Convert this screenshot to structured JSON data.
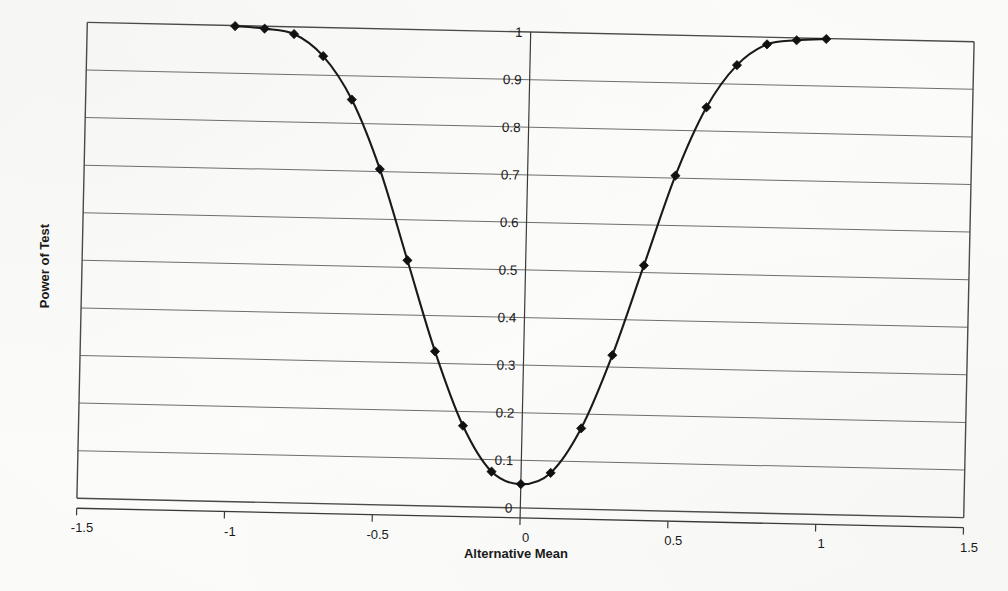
{
  "chart_data": {
    "type": "line",
    "title": "",
    "xlabel": "Alternative Mean",
    "ylabel": "Power of Test",
    "xlim": [
      -1.5,
      1.5
    ],
    "ylim": [
      0,
      1
    ],
    "grid": "horizontal",
    "legend": "none",
    "marker": "diamond",
    "line_color": "#1a1a1a",
    "marker_color": "#111111",
    "grid_color": "#6e6e6e",
    "axis_color": "#4a4a4a",
    "x_ticks": [
      "-1.5",
      "-1",
      "-0.5",
      "0",
      "0.5",
      "1",
      "1.5"
    ],
    "x_tick_values": [
      -1.5,
      -1,
      -0.5,
      0,
      0.5,
      1,
      1.5
    ],
    "y_ticks": [
      "0",
      "0.1",
      "0.2",
      "0.3",
      "0.4",
      "0.5",
      "0.6",
      "0.7",
      "0.8",
      "0.9",
      "1"
    ],
    "y_tick_values": [
      0,
      0.1,
      0.2,
      0.3,
      0.4,
      0.5,
      0.6,
      0.7,
      0.8,
      0.9,
      1
    ],
    "series": [
      {
        "name": "Power",
        "x": [
          -1.0,
          -0.9,
          -0.8,
          -0.7,
          -0.6,
          -0.5,
          -0.4,
          -0.3,
          -0.2,
          -0.1,
          0.0,
          0.1,
          0.2,
          0.3,
          0.4,
          0.5,
          0.6,
          0.7,
          0.8,
          0.9,
          1.0
        ],
        "values": [
          0.999,
          0.995,
          0.985,
          0.94,
          0.85,
          0.705,
          0.515,
          0.325,
          0.17,
          0.075,
          0.05,
          0.075,
          0.17,
          0.325,
          0.515,
          0.705,
          0.85,
          0.94,
          0.985,
          0.995,
          0.999
        ]
      }
    ]
  },
  "plot": {
    "left": 82,
    "top": 32,
    "right": 969,
    "bottom": 508,
    "skew_deg": 1.25
  },
  "axes": {
    "x_axis_title": "Alternative Mean",
    "y_axis_title": "Power of Test"
  }
}
